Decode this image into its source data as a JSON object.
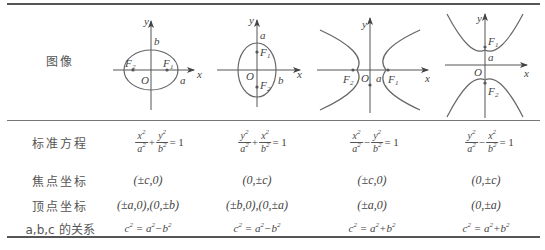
{
  "table": {
    "row_labels": {
      "graph": "图像",
      "standard_equation": "标准方程",
      "foci": "焦点坐标",
      "vertices": "顶点坐标",
      "relation": "a,b,c 的关系"
    },
    "columns": [
      {
        "curve": "ellipse-horizontal",
        "equation": {
          "t1_num": "x",
          "t1_den": "a",
          "op": "+",
          "t2_num": "y",
          "t2_den": "b",
          "rhs": "= 1"
        },
        "foci": "(±c,0)",
        "vertices": "(±a,0),(0,±b)",
        "relation": {
          "lhs": "c",
          "a": "a",
          "sign": "−",
          "b": "b"
        },
        "graph_labels": {
          "y": "y",
          "x": "x",
          "O": "O",
          "b": "b",
          "a": "a",
          "F1": "F",
          "F1_sub": "1",
          "F2": "F",
          "F2_sub": "2"
        }
      },
      {
        "curve": "ellipse-vertical",
        "equation": {
          "t1_num": "y",
          "t1_den": "a",
          "op": "+",
          "t2_num": "x",
          "t2_den": "b",
          "rhs": "= 1"
        },
        "foci": "(0,±c)",
        "vertices": "(±b,0),(0,±a)",
        "relation": {
          "lhs": "c",
          "a": "a",
          "sign": "−",
          "b": "b"
        },
        "graph_labels": {
          "y": "y",
          "x": "x",
          "O": "O",
          "a": "a",
          "b": "b",
          "F1": "F",
          "F1_sub": "1",
          "F2": "F",
          "F2_sub": "2"
        }
      },
      {
        "curve": "hyperbola-horizontal",
        "equation": {
          "t1_num": "x",
          "t1_den": "a",
          "op": "−",
          "t2_num": "y",
          "t2_den": "b",
          "rhs": "= 1"
        },
        "foci": "(±c,0)",
        "vertices": "(±a,0)",
        "relation": {
          "lhs": "c",
          "a": "a",
          "sign": "+",
          "b": "b"
        },
        "graph_labels": {
          "y": "y",
          "x": "x",
          "O": "O",
          "a": "a",
          "F1": "F",
          "F1_sub": "1",
          "F2": "F",
          "F2_sub": "2"
        }
      },
      {
        "curve": "hyperbola-vertical",
        "equation": {
          "t1_num": "y",
          "t1_den": "a",
          "op": "−",
          "t2_num": "x",
          "t2_den": "b",
          "rhs": "= 1"
        },
        "foci": "(0,±c)",
        "vertices": "(0,±a)",
        "relation": {
          "lhs": "c",
          "a": "a",
          "sign": "+",
          "b": "b"
        },
        "graph_labels": {
          "y": "y",
          "x": "x",
          "O": "O",
          "a": "a",
          "F1": "F",
          "F1_sub": "1",
          "F2": "F",
          "F2_sub": "2"
        }
      }
    ],
    "exponent": "2",
    "colors": {
      "curve": "#666666",
      "axis": "#555555",
      "rule": "#555555",
      "text": "#444444"
    }
  }
}
